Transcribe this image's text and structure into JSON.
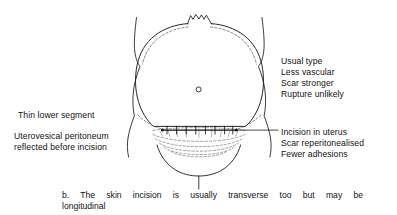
{
  "figure": {
    "label": "b",
    "umbilicus_name": "umbilicus",
    "stroke_color": "#1a1a1a",
    "dashed_color": "#555555",
    "background_color": "#ffffff"
  },
  "annotations": {
    "right_top": {
      "name": "advantages-list",
      "lines": [
        "Usual type",
        "Less vascular",
        "Scar stronger",
        "Rupture unlikely"
      ]
    },
    "right_bottom": {
      "name": "incision-notes",
      "lines": [
        "Incision in uterus",
        "Scar reperitonealised",
        "Fewer adhesions"
      ]
    },
    "left_top": {
      "name": "lower-segment-note",
      "lines": [
        "Thin lower segment"
      ]
    },
    "left_bottom": {
      "name": "peritoneum-note",
      "lines": [
        "Uterovesical peritoneum",
        "reflected before incision"
      ]
    }
  },
  "caption": {
    "line_1": "b. The skin incision is usually transverse too but may be",
    "line_2": "longitudinal"
  }
}
